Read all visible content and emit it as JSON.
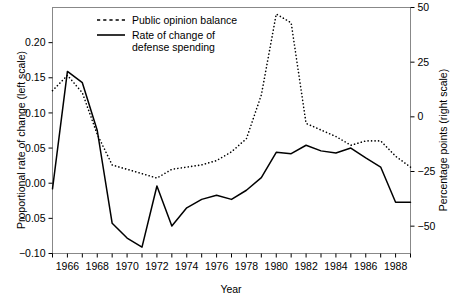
{
  "chart_data": {
    "type": "line",
    "title": "",
    "xlabel": "Year",
    "ylabel": "Proportional rate of change (left scale)",
    "ylabel_right": "Percentage points (right scale)",
    "xlim": [
      1965,
      1989
    ],
    "ylim": [
      -0.1,
      0.25
    ],
    "ylim_right": [
      -62.5,
      50
    ],
    "grid": false,
    "legend_position": "top-center",
    "x_ticks": [
      1965,
      1966,
      1967,
      1968,
      1969,
      1970,
      1971,
      1972,
      1973,
      1974,
      1975,
      1976,
      1977,
      1978,
      1979,
      1980,
      1981,
      1982,
      1983,
      1984,
      1985,
      1986,
      1987,
      1988,
      1989
    ],
    "x_tick_labels": [
      "",
      "1966",
      "",
      "1968",
      "",
      "1970",
      "",
      "1972",
      "",
      "1974",
      "",
      "1976",
      "",
      "1978",
      "",
      "1980",
      "",
      "1982",
      "",
      "1984",
      "",
      "1986",
      "",
      "1988",
      ""
    ],
    "y_ticks_left": [
      -0.1,
      -0.05,
      0.0,
      0.05,
      0.1,
      0.15,
      0.2
    ],
    "y_tick_labels_left": [
      "-0.10",
      "-0.05",
      "0.00",
      "0.05",
      "0.10",
      "0.15",
      "0.20"
    ],
    "y_ticks_right": [
      -50,
      -25,
      0,
      25,
      50
    ],
    "y_tick_labels_right": [
      "-50",
      "-25",
      "0",
      "25",
      "50"
    ],
    "series": [
      {
        "name": "Public opinion balance",
        "axis": "right",
        "style": "dashed",
        "color": "#000000",
        "x": [
          1965,
          1966,
          1967,
          1968,
          1969,
          1970,
          1971,
          1972,
          1973,
          1974,
          1975,
          1976,
          1977,
          1978,
          1979,
          1980,
          1981,
          1982,
          1983,
          1984,
          1985,
          1986,
          1987,
          1988,
          1989
        ],
        "values": [
          12,
          19,
          11,
          -8,
          -22,
          -24,
          -26,
          -28,
          -24,
          -23,
          -22,
          -20,
          -16,
          -10,
          10,
          47,
          43,
          -3,
          -6,
          -9,
          -13,
          -11,
          -11,
          -18,
          -23
        ]
      },
      {
        "name": "Rate of change of defense spending",
        "axis": "left",
        "style": "solid",
        "color": "#000000",
        "x": [
          1965,
          1966,
          1967,
          1968,
          1969,
          1970,
          1971,
          1972,
          1973,
          1974,
          1975,
          1976,
          1977,
          1978,
          1979,
          1980,
          1981,
          1982,
          1983,
          1984,
          1985,
          1986,
          1987,
          1988,
          1989
        ],
        "values": [
          -0.008,
          0.159,
          0.143,
          0.075,
          -0.057,
          -0.078,
          -0.091,
          -0.004,
          -0.061,
          -0.035,
          -0.023,
          -0.017,
          -0.023,
          -0.01,
          0.008,
          0.044,
          0.042,
          0.054,
          0.046,
          0.043,
          0.05,
          0.036,
          0.023,
          -0.027,
          -0.027
        ]
      }
    ],
    "legend": [
      {
        "label": "Public opinion balance",
        "style": "dashed"
      },
      {
        "label": "Rate of change of",
        "label2": "defense spending",
        "style": "solid"
      }
    ]
  }
}
